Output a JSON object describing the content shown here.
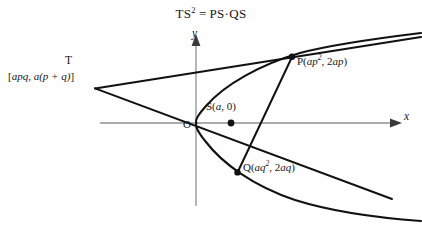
{
  "figure": {
    "title": {
      "lhs_base": "TS",
      "lhs_exponent": "2",
      "equals": "=",
      "rhs": "PS·QS"
    },
    "colors": {
      "background": "#fefefe",
      "ink": "#171717",
      "axis": "#8c8c8c",
      "curve": "#111111",
      "line": "#111111"
    },
    "axes": {
      "x_axis_label": "x",
      "y_axis_label": "y",
      "origin_label": "O",
      "x_axis_y_px": 123,
      "y_axis_x_px": 196,
      "x_axis_arrow": true,
      "y_axis_arrow": true,
      "grid": false
    },
    "points": [
      {
        "name": "T",
        "label": "T",
        "coordinate_label_open": "[",
        "coordinate_label_text": "apq, a(p + q)",
        "coordinate_label_close": "]",
        "x_px": 95,
        "y_px": 88,
        "marker": false
      },
      {
        "name": "P",
        "label_prefix": "P(",
        "label_x_base": "ap",
        "label_x_exponent": "2",
        "label_sep": ", 2",
        "label_y": "ap",
        "label_suffix": ")",
        "x_px": 292,
        "y_px": 57,
        "marker": true
      },
      {
        "name": "Q",
        "label_prefix": "Q(",
        "label_x_base": "aq",
        "label_x_exponent": "2",
        "label_sep": ", 2",
        "label_y": "aq",
        "label_suffix": ")",
        "x_px": 237,
        "y_px": 172,
        "marker": true
      },
      {
        "name": "S",
        "label_prefix": "S(",
        "label_x": "a",
        "label_sep": ", ",
        "label_y": "0",
        "label_suffix": ")",
        "x_px": 231,
        "y_px": 123,
        "marker": true
      }
    ],
    "curve": {
      "type": "parabola",
      "equation": "y^2 = 4ax",
      "opens": "right",
      "vertex_px": [
        196,
        123
      ],
      "focus_px": [
        231,
        123
      ]
    },
    "lines": [
      {
        "name": "tangent-at-P",
        "from_px": [
          95,
          88
        ],
        "through_px": [
          292,
          57
        ],
        "to_px": [
          421,
          37
        ]
      },
      {
        "name": "tangent-at-Q",
        "from_px": [
          95,
          88
        ],
        "through_px": [
          237,
          172
        ],
        "to_px": [
          392,
          199
        ]
      },
      {
        "name": "focal-chord-PQ",
        "from_px": [
          292,
          57
        ],
        "to_px": [
          237,
          172
        ]
      }
    ]
  }
}
